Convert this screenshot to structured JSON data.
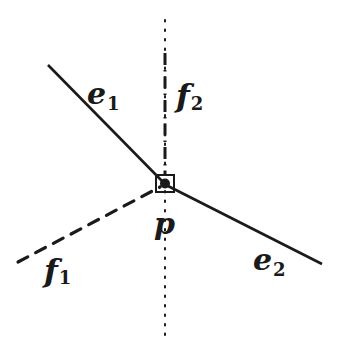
{
  "diagram": {
    "vertex": {
      "label": "p",
      "x": 165,
      "y": 184
    },
    "edges": [
      {
        "id": "e1",
        "label": "e",
        "subscript": "1",
        "style": "solid",
        "from": [
          48,
          65
        ],
        "to": [
          165,
          184
        ]
      },
      {
        "id": "e2",
        "label": "e",
        "subscript": "2",
        "style": "solid",
        "from": [
          165,
          184
        ],
        "to": [
          322,
          264
        ]
      }
    ],
    "faces": [
      {
        "id": "f1",
        "label": "f",
        "subscript": "1",
        "style": "dashed",
        "from": [
          18,
          262
        ],
        "to": [
          165,
          184
        ]
      },
      {
        "id": "f2",
        "label": "f",
        "subscript": "2",
        "style": "dash-dot",
        "from": [
          165,
          52
        ],
        "to": [
          165,
          175
        ]
      }
    ],
    "vertical_line": {
      "style": "dotted",
      "x": 165,
      "y_top": 20,
      "y_bottom": 340
    },
    "colors": {
      "stroke": "#1a1a1a",
      "background": "#ffffff"
    }
  },
  "labels": {
    "e1": {
      "main": "e",
      "sub": "1"
    },
    "e2": {
      "main": "e",
      "sub": "2"
    },
    "f1": {
      "main": "f",
      "sub": "1"
    },
    "f2": {
      "main": "f",
      "sub": "2"
    },
    "p": "p"
  }
}
